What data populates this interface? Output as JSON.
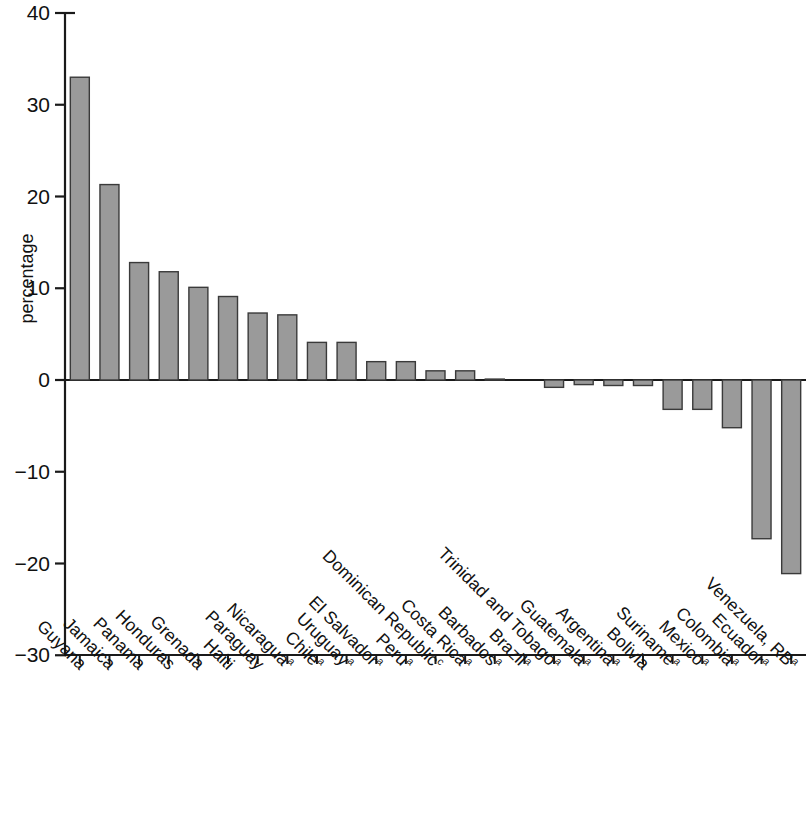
{
  "chart_data": {
    "type": "bar",
    "title": "",
    "subtitle": "",
    "xlabel": "",
    "ylabel": "percentage",
    "ylim": [
      -30,
      40
    ],
    "yticks": [
      40,
      30,
      20,
      10,
      0,
      -10,
      -20,
      -30
    ],
    "ytick_labels": [
      "40",
      "30",
      "20",
      "10",
      "0",
      "−10",
      "−20",
      "−30"
    ],
    "grid": false,
    "legend": "none",
    "bar_color": "#9a9a9a",
    "bar_edge_color": "#3a3a3a",
    "axis_color": "#1a1a1a",
    "categories": [
      "Guyana",
      "Jamaica",
      "Panama",
      "Honduras",
      "Grenada",
      "Haiti",
      "Paraguay",
      "Nicaragua",
      "Chile",
      "Uruguay",
      "El Salvador",
      "Peru",
      "Dominican Republic",
      "Costa Rica",
      "Barbados",
      "Brazil",
      "Trinidad and Tobago",
      "Guatemala",
      "Argentina",
      "Bolivia",
      "Suriname",
      "Mexico",
      "Colombia",
      "Ecuador",
      "Venezuela, RB"
    ],
    "category_footnotes": [
      "",
      "",
      "",
      "",
      "",
      "",
      "",
      "a",
      "a",
      "a",
      "a",
      "a",
      "c",
      "a",
      "a",
      "a",
      "a",
      "a",
      "a",
      "",
      "a",
      "a",
      "a",
      "a",
      "a"
    ],
    "values": [
      33.0,
      21.3,
      12.8,
      11.8,
      10.1,
      9.1,
      7.3,
      7.1,
      4.1,
      4.1,
      2.0,
      2.0,
      1.0,
      1.0,
      0.1,
      0.0,
      -0.8,
      -0.5,
      -0.6,
      -0.6,
      -3.2,
      -3.2,
      -5.2,
      -17.3,
      -21.1
    ]
  }
}
